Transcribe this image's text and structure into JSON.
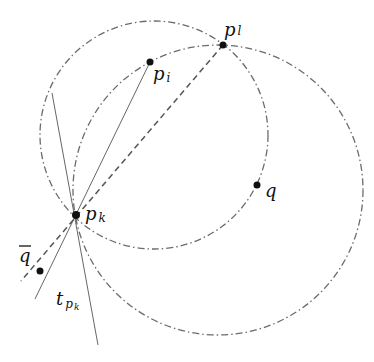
{
  "diagram": {
    "colors": {
      "background": "#ffffff",
      "circle_stroke": "#6b6b6b",
      "line_stroke": "#555555",
      "dashed_stroke": "#555555",
      "point_fill": "#111111",
      "label": "#111111"
    },
    "points": {
      "p_k": {
        "x": 76,
        "y": 215
      },
      "p_i": {
        "x": 150,
        "y": 62
      },
      "p_l": {
        "x": 223,
        "y": 45
      },
      "q": {
        "x": 257,
        "y": 185
      },
      "q_bar": {
        "x": 40,
        "y": 271
      }
    },
    "labels": {
      "p_i": {
        "main": "p",
        "sub": "i"
      },
      "p_l": {
        "main": "p",
        "sub": "l"
      },
      "p_k": {
        "main": "p",
        "sub": "k"
      },
      "q": {
        "main": "q"
      },
      "q_bar": {
        "main": "q"
      },
      "t_pk": {
        "main": "t",
        "sub": "p",
        "subsub": "k"
      }
    },
    "circles": [
      {
        "name": "small-circle",
        "cx": 154,
        "cy": 135,
        "r": 114,
        "style": "dash-dot"
      },
      {
        "name": "large-circle",
        "cx": 218,
        "cy": 190,
        "r": 145,
        "style": "dash-dot"
      }
    ],
    "lines": [
      {
        "name": "line-pi-pk",
        "x1": 150,
        "y1": 62,
        "x2": 35,
        "y2": 299,
        "style": "solid"
      },
      {
        "name": "line-pl-pk-qbar",
        "x1": 223,
        "y1": 45,
        "x2": 21,
        "y2": 281,
        "style": "dashed"
      },
      {
        "name": "tangent-t-pk",
        "x1": 52,
        "y1": 93,
        "x2": 98,
        "y2": 345,
        "style": "solid"
      }
    ]
  }
}
